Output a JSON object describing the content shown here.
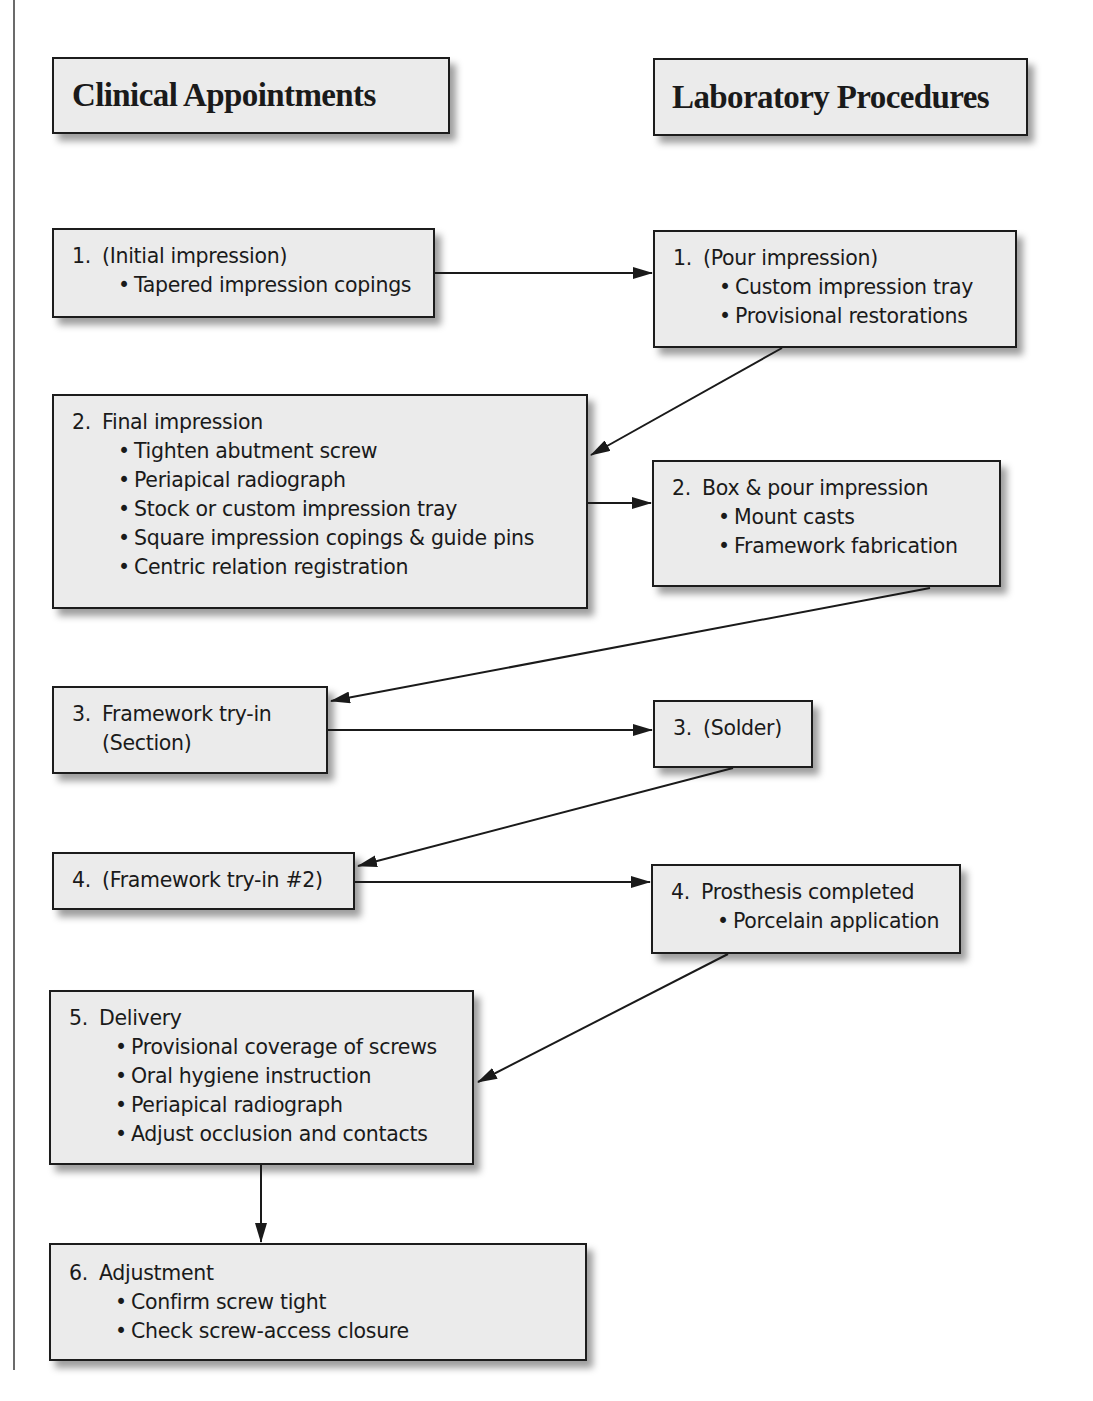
{
  "headers": {
    "clinical": "Clinical Appointments",
    "laboratory": "Laboratory Procedures"
  },
  "clinical_steps": [
    {
      "num": "1.",
      "title": "(Initial impression)",
      "bullets": [
        "Tapered impression copings"
      ]
    },
    {
      "num": "2.",
      "title": "Final impression",
      "bullets": [
        "Tighten abutment screw",
        "Periapical radiograph",
        "Stock or custom impression tray",
        "Square impression copings & guide pins",
        "Centric relation registration"
      ]
    },
    {
      "num": "3.",
      "title": "Framework try-in",
      "subline": "(Section)",
      "bullets": []
    },
    {
      "num": "4.",
      "title": "(Framework try-in #2)",
      "bullets": []
    },
    {
      "num": "5.",
      "title": "Delivery",
      "bullets": [
        "Provisional coverage of screws",
        "Oral hygiene instruction",
        "Periapical radiograph",
        "Adjust occlusion and contacts"
      ]
    },
    {
      "num": "6.",
      "title": "Adjustment",
      "bullets": [
        "Confirm screw tight",
        "Check screw-access closure"
      ]
    }
  ],
  "lab_steps": [
    {
      "num": "1.",
      "title": "(Pour impression)",
      "bullets": [
        "Custom impression tray",
        "Provisional restorations"
      ]
    },
    {
      "num": "2.",
      "title": "Box & pour impression",
      "bullets": [
        "Mount casts",
        "Framework fabrication"
      ]
    },
    {
      "num": "3.",
      "title": "(Solder)",
      "bullets": []
    },
    {
      "num": "4.",
      "title": "Prosthesis completed",
      "bullets": [
        "Porcelain application"
      ]
    }
  ],
  "flow": [
    {
      "from": "clinical-1",
      "to": "lab-1"
    },
    {
      "from": "lab-1",
      "to": "clinical-2"
    },
    {
      "from": "clinical-2",
      "to": "lab-2"
    },
    {
      "from": "lab-2",
      "to": "clinical-3"
    },
    {
      "from": "clinical-3",
      "to": "lab-3"
    },
    {
      "from": "lab-3",
      "to": "clinical-4"
    },
    {
      "from": "clinical-4",
      "to": "lab-4"
    },
    {
      "from": "lab-4",
      "to": "clinical-5"
    },
    {
      "from": "clinical-5",
      "to": "clinical-6"
    }
  ],
  "colors": {
    "box_fill": "#ebebeb",
    "box_border": "#1c1c1c",
    "arrow": "#1a1a1a",
    "text": "#1a1a1a"
  }
}
